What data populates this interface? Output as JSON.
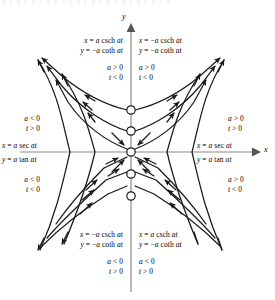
{
  "figure": {
    "type": "phase-portrait",
    "axes": {
      "x_label": "x",
      "y_label": "y"
    },
    "background": "#ffffff",
    "stroke": "#1a1a1a",
    "axis_color": "#8a8a8a"
  },
  "quadrant_labels": {
    "top_left": {
      "eq1": "x =  a csch at",
      "eq2": "y = −a coth at",
      "cond1": "a > 0",
      "cond2": "t < 0"
    },
    "top_right": {
      "eq1": "x = −a csch at",
      "eq2": "y = −a coth at",
      "cond1": "a > 0",
      "cond2": "t < 0"
    },
    "bottom_left": {
      "eq1": "x = −a csch at",
      "eq2": "y = −a coth at",
      "cond1": "a < 0",
      "cond2": "t > 0"
    },
    "bottom_right": {
      "eq1": "x =  a csch at",
      "eq2": "y = −a coth at",
      "cond1": "a < 0",
      "cond2": "t > 0"
    }
  },
  "side_labels": {
    "left_upper": {
      "cond1": "a < 0",
      "cond2": "t > 0"
    },
    "left_axis": {
      "eq1": "x = a sec at",
      "eq2": "y = a tan at"
    },
    "left_lower": {
      "cond1": "a < 0",
      "cond2": "t < 0"
    },
    "right_upper": {
      "cond1": "a > 0",
      "cond2": "t > 0"
    },
    "right_axis": {
      "eq1": "x = a sec at",
      "eq2": "y = a tan at"
    },
    "right_lower": {
      "cond1": "a > 0",
      "cond2": "t < 0"
    }
  },
  "chart_data": {
    "type": "scatter",
    "title": "",
    "xlabel": "x",
    "ylabel": "y",
    "origin_px": [
      131,
      152
    ],
    "open_circles_y_axis": [
      110,
      131,
      152,
      174,
      196
    ],
    "open_circle_radius": 4.2
  }
}
